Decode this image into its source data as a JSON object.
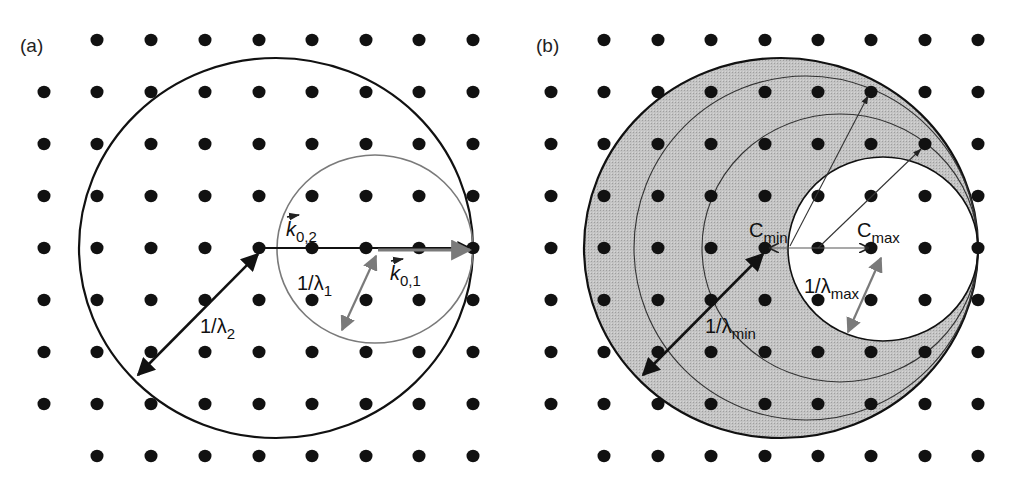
{
  "figure": {
    "colors": {
      "dot": "#111111",
      "line": "#111111",
      "gray_arrow": "#7a7a7a",
      "shade": "#bdbdbd",
      "background": "#ffffff"
    },
    "lattice": {
      "spacing_x": 53.6,
      "spacing_y": 52,
      "rows_y": [
        40,
        92,
        144,
        196,
        248,
        300,
        352,
        404,
        456
      ],
      "dot_radius": 6.5
    },
    "panels": [
      {
        "id": "a",
        "label": "(a)",
        "label_pos": [
          20,
          52
        ],
        "cols_x": [
          44,
          97,
          151,
          205,
          259,
          312,
          366,
          419,
          473
        ],
        "origin": [
          473,
          248
        ],
        "circles": [
          {
            "name": "ewald-sphere-lambda2",
            "cx": 276,
            "cy": 248,
            "rx": 197,
            "ry": 190,
            "stroke": "#111111",
            "width": 2.2
          },
          {
            "name": "ewald-sphere-lambda1",
            "cx": 375,
            "cy": 249,
            "rx": 98,
            "ry": 94,
            "stroke": "#7a7a7a",
            "width": 1.6
          }
        ],
        "vectors": {
          "k02": {
            "label": "k",
            "sub": "0,2",
            "from": [
              265,
              248
            ],
            "to": [
              470,
              248
            ],
            "label_pos": [
              286,
              236
            ]
          },
          "k01": {
            "label": "k",
            "sub": "0,1",
            "from": [
              378,
              250
            ],
            "to": [
              470,
              250
            ],
            "label_pos": [
              390,
              280
            ]
          },
          "inv_lambda1": {
            "text": "1/λ",
            "sub": "1",
            "from": [
              376,
              256
            ],
            "to": [
              342,
              330
            ],
            "label_pos": [
              297,
              290
            ]
          },
          "inv_lambda2": {
            "text": "1/λ",
            "sub": "2",
            "from": [
              258,
              254
            ],
            "to": [
              138,
              375
            ],
            "label_pos": [
              200,
              333
            ]
          }
        }
      },
      {
        "id": "b",
        "label": "(b)",
        "label_pos": [
          536,
          52
        ],
        "cols_x": [
          551,
          604,
          658,
          711,
          765,
          818,
          871,
          925,
          978
        ],
        "origin": [
          978,
          248
        ],
        "circles": [
          {
            "name": "ewald-sphere-lambda-min",
            "cx": 781,
            "cy": 248,
            "rx": 197,
            "ry": 190,
            "stroke": "#111111",
            "width": 2.2
          },
          {
            "name": "ewald-sphere-intermediate-1",
            "cx": 806,
            "cy": 248,
            "rx": 172,
            "ry": 172,
            "stroke": "#333333",
            "width": 1.1
          },
          {
            "name": "ewald-sphere-intermediate-2",
            "cx": 840,
            "cy": 248,
            "rx": 138,
            "ry": 134,
            "stroke": "#333333",
            "width": 1.1
          },
          {
            "name": "ewald-sphere-lambda-max",
            "cx": 883,
            "cy": 249,
            "rx": 95,
            "ry": 92,
            "stroke": "#111111",
            "width": 1.6
          }
        ],
        "labels": {
          "cmin": {
            "text": "C",
            "sub": "min",
            "pos": [
              749,
              237
            ]
          },
          "cmax": {
            "text": "C",
            "sub": "max",
            "pos": [
              857,
              237
            ]
          },
          "inv_lambda_max": {
            "text": "1/λ",
            "sub": "max",
            "pos": [
              804,
              293
            ]
          },
          "inv_lambda_min": {
            "text": "1/λ",
            "sub": "min",
            "pos": [
              705,
              333
            ]
          }
        },
        "vectors": {
          "center_span": {
            "from": [
              770,
              248
            ],
            "to": [
              868,
              248
            ]
          },
          "inv_lambda_max": {
            "from": [
              881,
              258
            ],
            "to": [
              848,
              332
            ]
          },
          "inv_lambda_min": {
            "from": [
              763,
              254
            ],
            "to": [
              643,
              375
            ]
          },
          "ray_1": {
            "from": [
              790,
              246
            ],
            "to": [
              868,
              96
            ]
          },
          "ray_2": {
            "from": [
              818,
              248
            ],
            "to": [
              921,
              149
            ]
          }
        }
      }
    ]
  }
}
